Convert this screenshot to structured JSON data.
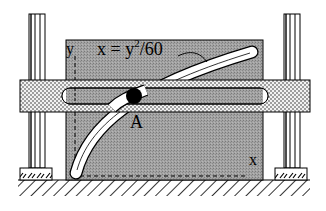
{
  "diagram": {
    "type": "mechanism",
    "labels": {
      "equation_prefix": "x = y",
      "equation_exponent": "2",
      "equation_suffix": "/60",
      "y_axis": "y",
      "x_axis": "x",
      "pin": "A"
    },
    "components": [
      {
        "name": "left-guide-column",
        "kind": "vertical rod"
      },
      {
        "name": "right-guide-column",
        "kind": "vertical rod"
      },
      {
        "name": "horizontal-slotted-bar",
        "kind": "dotted bar with straight slot"
      },
      {
        "name": "gray-plate",
        "kind": "plate with parabolic slot"
      },
      {
        "name": "pin-A",
        "kind": "black circle pin"
      },
      {
        "name": "left-foot",
        "kind": "hatched support block"
      },
      {
        "name": "right-foot",
        "kind": "hatched support block"
      },
      {
        "name": "ground",
        "kind": "hatched ground"
      }
    ],
    "colors": {
      "plate": "#9a9a9a",
      "bar": "#e6e6e6",
      "ink": "#000000",
      "slot": "#ffffff"
    }
  }
}
